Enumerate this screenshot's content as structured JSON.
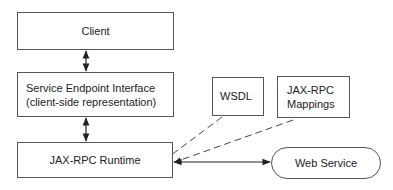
{
  "diagram": {
    "nodes": {
      "client": {
        "label": "Client"
      },
      "sei": {
        "line1": "Service Endpoint Interface",
        "line2": "(client-side representation)"
      },
      "runtime": {
        "label": "JAX-RPC Runtime"
      },
      "wsdl": {
        "label": "WSDL"
      },
      "mappings": {
        "line1": "JAX-RPC",
        "line2": "Mappings"
      },
      "webservice": {
        "label": "Web Service"
      }
    },
    "edges": [
      {
        "from": "client",
        "to": "sei",
        "style": "solid",
        "direction": "both"
      },
      {
        "from": "sei",
        "to": "runtime",
        "style": "solid",
        "direction": "both"
      },
      {
        "from": "wsdl",
        "to": "runtime",
        "style": "dashed",
        "direction": "to"
      },
      {
        "from": "mappings",
        "to": "runtime",
        "style": "dashed",
        "direction": "to"
      },
      {
        "from": "runtime",
        "to": "webservice",
        "style": "solid",
        "direction": "both"
      }
    ]
  }
}
